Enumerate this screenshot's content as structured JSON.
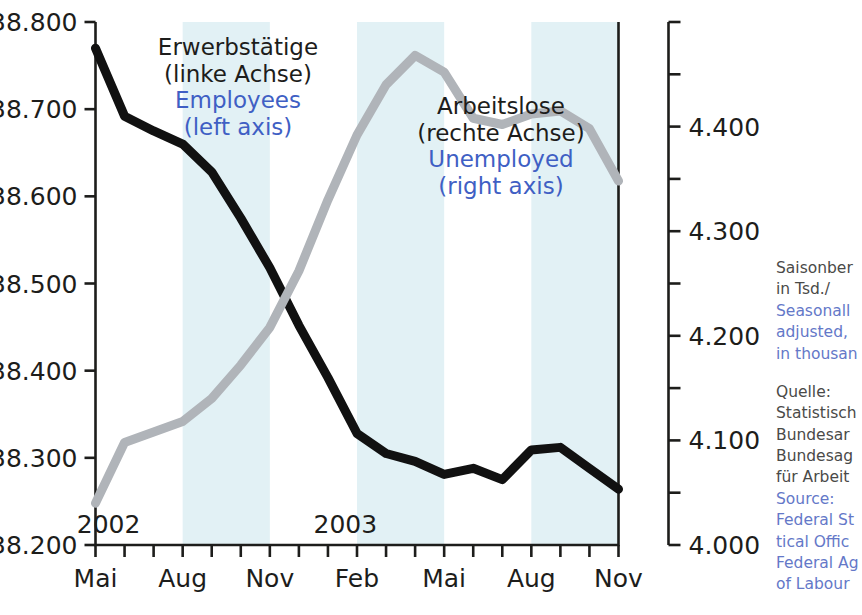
{
  "chart_data": {
    "type": "line",
    "title": "",
    "xlabel": "",
    "grid": false,
    "legend_position": "inside-plot",
    "x": [
      "Mai 2002",
      "Jun 2002",
      "Jul 2002",
      "Aug 2002",
      "Sep 2002",
      "Okt 2002",
      "Nov 2002",
      "Dez 2002",
      "Jan 2003",
      "Feb 2003",
      "Mrz 2003",
      "Apr 2003",
      "Mai 2003",
      "Jun 2003",
      "Jul 2003",
      "Aug 2003",
      "Sep 2003",
      "Okt 2003",
      "Nov 2003"
    ],
    "xtick_labels": [
      "Mai",
      "",
      "",
      "Aug",
      "",
      "",
      "Nov",
      "",
      "",
      "Feb",
      "",
      "",
      "Mai",
      "",
      "",
      "Aug",
      "",
      "",
      "Nov"
    ],
    "year_markers": [
      {
        "label": "2002",
        "x_index": 0.45
      },
      {
        "label": "2003",
        "x_index": 8.6
      }
    ],
    "axes": [
      {
        "id": "left",
        "name": "Erwerbstätige (linke Achse)",
        "ylim": [
          38200,
          38800
        ],
        "ytick_labels": [
          "38.200",
          "38.300",
          "38.400",
          "38.500",
          "38.600",
          "38.700",
          "38.800"
        ],
        "ytick_values": [
          38200,
          38300,
          38400,
          38500,
          38600,
          38700,
          38800
        ],
        "minor_ticks": false
      },
      {
        "id": "right",
        "name": "Arbeitslose (rechte Achse)",
        "ylim": [
          4000,
          4500
        ],
        "ytick_labels": [
          "4.000",
          "4.100",
          "4.200",
          "4.300",
          "4.400",
          ""
        ],
        "ytick_values": [
          4000,
          4100,
          4200,
          4300,
          4400,
          4500
        ],
        "minor_tick_values": [
          4050,
          4150,
          4250,
          4350,
          4450
        ],
        "minor_ticks": true
      }
    ],
    "series": [
      {
        "name": "Erwerbstätige / Employees",
        "axis": "left",
        "color": "#111111",
        "linewidth": 9,
        "values": [
          38770,
          38692,
          38675,
          38660,
          38628,
          38575,
          38518,
          38452,
          38392,
          38328,
          38305,
          38296,
          38281,
          38288,
          38275,
          38309,
          38312,
          38288,
          38264
        ]
      },
      {
        "name": "Arbeitslose / Unemployed",
        "axis": "right",
        "color": "#b0b4b9",
        "linewidth": 9,
        "values": [
          4040,
          4098,
          4108,
          4118,
          4140,
          4172,
          4208,
          4262,
          4330,
          4392,
          4440,
          4468,
          4452,
          4408,
          4402,
          4412,
          4415,
          4398,
          4348
        ]
      }
    ],
    "shaded_bands": [
      {
        "from_index": 3,
        "to_index": 6
      },
      {
        "from_index": 9,
        "to_index": 12
      },
      {
        "from_index": 15,
        "to_index": 18
      }
    ],
    "band_color": "#e2f1f5"
  },
  "annotations": {
    "employees": {
      "de_line1": "Erwerbstätige",
      "de_line2": "(linke Achse)",
      "en_line1": "Employees",
      "en_line2": "(left axis)"
    },
    "unemployed": {
      "de_line1": "Arbeitslose",
      "de_line2": "(rechte Achse)",
      "en_line1": "Unemployed",
      "en_line2": "(right axis)"
    }
  },
  "side_notes": {
    "units": {
      "de_line1": "Saisonber",
      "de_line2": "in Tsd./",
      "en_line1": "Seasonall",
      "en_line2": "adjusted,",
      "en_line3": "in thousan"
    },
    "source": {
      "de_line1": "Quelle:",
      "de_line2": "Statistisch",
      "de_line3": "Bundesar",
      "de_line4": "Bundesag",
      "de_line5": "für Arbeit",
      "en_line1": "Source:",
      "en_line2": "Federal St",
      "en_line3": "tical Offic",
      "en_line4": "Federal Ag",
      "en_line5": "of Labour"
    }
  },
  "colors": {
    "employees_line": "#111111",
    "unemployed_line": "#b0b4b9",
    "band": "#e2f1f5",
    "english_text": "#3f5fc4",
    "german_text": "#1d1d1b",
    "axis": "#1d1d1b"
  }
}
